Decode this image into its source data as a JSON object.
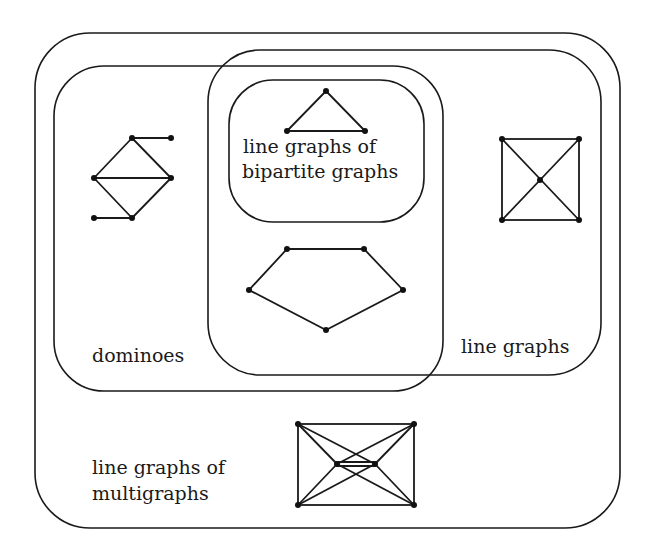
{
  "diagram": {
    "title": "",
    "type": "nested-set-inclusion-diagram",
    "stroke_color": "#1a1a1a",
    "background": "#ffffff"
  },
  "regions": [
    {
      "id": "multigraphs",
      "label_lines": [
        "line graphs of",
        "multigraphs"
      ]
    },
    {
      "id": "line-graphs",
      "label_lines": [
        "line graphs"
      ]
    },
    {
      "id": "dominoes",
      "label_lines": [
        "dominoes"
      ]
    },
    {
      "id": "bipartite",
      "label_lines": [
        "line graphs of",
        "bipartite graphs"
      ]
    }
  ],
  "labels": {
    "multigraphs_line1": "line graphs of",
    "multigraphs_line2": "multigraphs",
    "line_graphs": "line graphs",
    "dominoes": "dominoes",
    "bipartite_line1": "line graphs of",
    "bipartite_line2": "bipartite graphs"
  },
  "example_graphs": [
    {
      "id": "triangle",
      "region": "bipartite",
      "vertices": 3,
      "edges": 3
    },
    {
      "id": "domino-with-pendants",
      "region": "dominoes-only",
      "vertices": 6,
      "edges": 7
    },
    {
      "id": "pentagon",
      "region": "dominoes-and-line-graphs",
      "vertices": 5,
      "edges": 5
    },
    {
      "id": "wheel-4",
      "region": "line-graphs-only",
      "vertices": 5,
      "edges": 8
    },
    {
      "id": "multigraph-line-graph",
      "region": "multigraphs-only",
      "vertices": 6,
      "edges": 13
    }
  ]
}
